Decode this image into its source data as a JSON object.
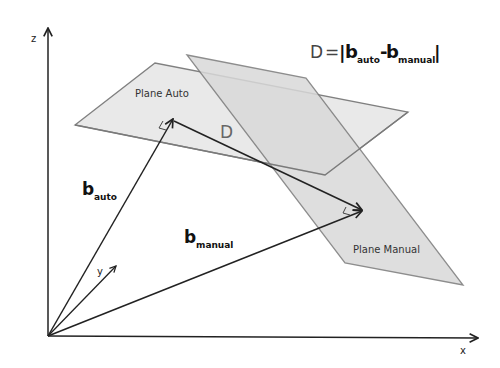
{
  "diagram": {
    "equation": {
      "lhs": "D",
      "equals": "=",
      "bar_left": "|",
      "b1": "b",
      "b1_sub": "auto",
      "minus": "-",
      "b2": "b",
      "b2_sub": "manual",
      "bar_right": "|"
    },
    "axes": {
      "z_label": "z",
      "x_label": "x",
      "y_label": "y"
    },
    "planes": {
      "auto_label": "Plane Auto",
      "manual_label": "Plane Manual"
    },
    "vectors": {
      "b_auto_main": "b",
      "b_auto_sub": "auto",
      "b_manual_main": "b",
      "b_manual_sub": "manual",
      "d_label": "D"
    },
    "colors": {
      "plane_fill": "#e6e6e6",
      "plane_overlap": "#cfcfcf",
      "plane_stroke": "#7a7a7a",
      "vector": "#222222"
    }
  }
}
